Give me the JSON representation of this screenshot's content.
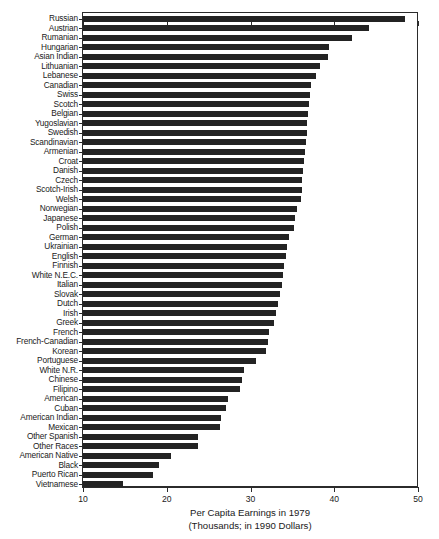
{
  "chart_data": {
    "type": "bar",
    "orientation": "horizontal",
    "title": "",
    "xlabel": "Per Capita Earnings in 1979",
    "xlabel_sub": "(Thousands; in 1990 Dollars)",
    "ylabel": "",
    "xlim": [
      10,
      50
    ],
    "xticks": [
      10,
      20,
      30,
      40,
      50
    ],
    "xtick_labels": [
      "10",
      "20",
      "30",
      "40",
      "50"
    ],
    "grid": false,
    "legend": false,
    "bar_color": "#232323",
    "axis_color": "#2b2b2b",
    "categories": [
      "Russian",
      "Austrian",
      "Rumanian",
      "Hungarian",
      "Asian Indian",
      "Lithuanian",
      "Lebanese",
      "Canadian",
      "Swiss",
      "Scotch",
      "Belgian",
      "Yugoslavian",
      "Swedish",
      "Scandinavian",
      "Armenian",
      "Croat",
      "Danish",
      "Czech",
      "Scotch-Irish",
      "Welsh",
      "Norwegian",
      "Japanese",
      "Polish",
      "German",
      "Ukrainian",
      "English",
      "Finnish",
      "White N.E.C.",
      "Italian",
      "Slovak",
      "Dutch",
      "Irish",
      "Greek",
      "French",
      "French-Canadian",
      "Korean",
      "Portuguese",
      "White N.R.",
      "Chinese",
      "Filipino",
      "American",
      "Cuban",
      "American Indian",
      "Mexican",
      "Other Spanish",
      "Other Races",
      "American Native",
      "Black",
      "Puerto Rican",
      "Vietnamese"
    ],
    "values": [
      48.5,
      44.2,
      42.1,
      39.4,
      39.2,
      38.3,
      37.8,
      37.2,
      37.1,
      37.0,
      36.9,
      36.8,
      36.7,
      36.6,
      36.5,
      36.4,
      36.3,
      36.2,
      36.1,
      36.0,
      35.5,
      35.3,
      35.2,
      34.6,
      34.4,
      34.2,
      34.0,
      33.9,
      33.8,
      33.5,
      33.3,
      33.0,
      32.8,
      32.2,
      32.1,
      31.9,
      30.6,
      29.2,
      29.0,
      28.7,
      27.3,
      27.1,
      26.5,
      26.4,
      23.7,
      23.7,
      20.5,
      19.1,
      18.4,
      14.8
    ]
  }
}
